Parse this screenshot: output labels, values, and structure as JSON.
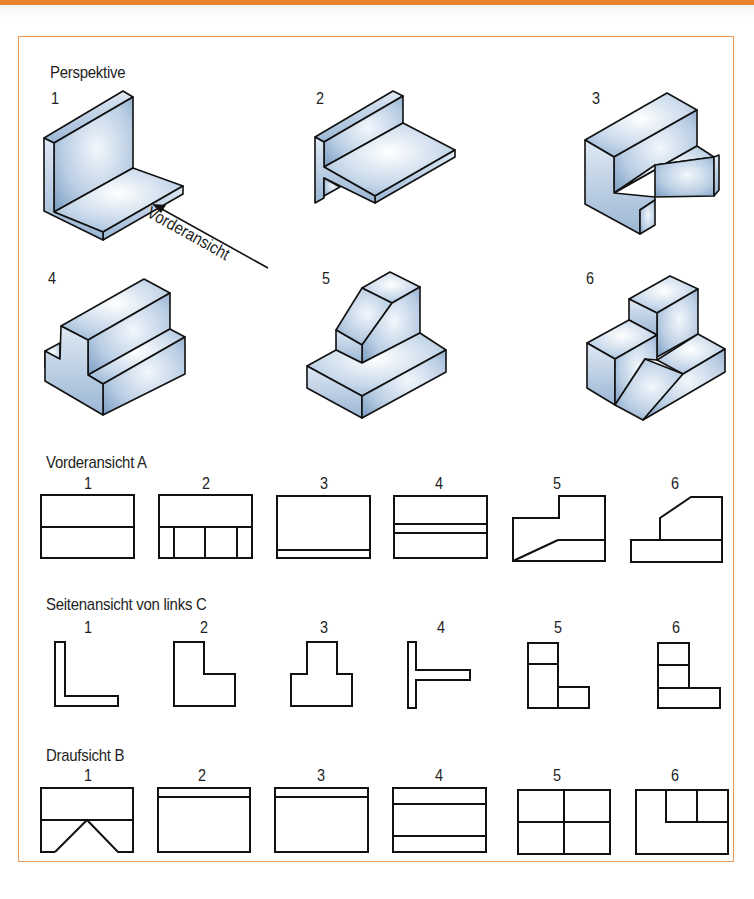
{
  "sections": {
    "perspective": {
      "title": "Perspektive",
      "items": [
        {
          "number": "1",
          "shape": "L-profile angle"
        },
        {
          "number": "2",
          "shape": "T-like profile with overhang"
        },
        {
          "number": "3",
          "shape": "stepped block with notch"
        },
        {
          "number": "4",
          "shape": "stepped block"
        },
        {
          "number": "5",
          "shape": "block with chamfered riser"
        },
        {
          "number": "6",
          "shape": "stepped block with slope"
        }
      ],
      "arrow": {
        "label": "Vorderansicht"
      }
    },
    "front_view": {
      "title": "Vorderansicht A",
      "numbers": [
        "1",
        "2",
        "3",
        "4",
        "5",
        "6"
      ]
    },
    "side_view": {
      "title": "Seitenansicht von links C",
      "numbers": [
        "1",
        "2",
        "3",
        "4",
        "5",
        "6"
      ]
    },
    "top_view": {
      "title": "Draufsicht B",
      "numbers": [
        "1",
        "2",
        "3",
        "4",
        "5",
        "6"
      ]
    }
  },
  "colors": {
    "accent_bar": "#e8842c",
    "frame_border": "#ec9a5a",
    "face_light": "#e8f0f8",
    "face_dark": "#7d9fc4",
    "stroke": "#111111"
  }
}
